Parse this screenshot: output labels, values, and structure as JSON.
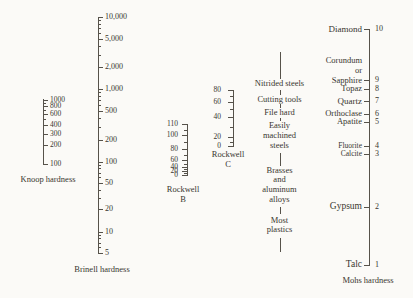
{
  "figure": {
    "bg_color": "#fbfaf7",
    "ink_color": "#39362f",
    "line_color": "#56524a"
  },
  "chart_data": {
    "type": "nomogram",
    "layout_hint": "five vertical scales side by side; vertical position indicates equivalent hardness; middle column annotates typical materials",
    "scales": [
      {
        "id": "knoop",
        "title_lines": [
          "Knoop hardness"
        ],
        "scale_type": "logarithmic",
        "labels_side": "right",
        "geometry": {
          "line_x": 43,
          "top": 99,
          "bottom": 164.5,
          "label_x": 50,
          "num_fs": 7.5,
          "title_x": 48,
          "title_y": 179,
          "title_fs": 8.5,
          "tick_len": 5
        },
        "ticks": [
          {
            "v": 1000,
            "y": 99.5,
            "label": "1000"
          },
          {
            "v": 900,
            "y": 102.6
          },
          {
            "v": 800,
            "y": 105.9,
            "label": "800"
          },
          {
            "v": 700,
            "y": 109.7
          },
          {
            "v": 600,
            "y": 114.0,
            "label": "600"
          },
          {
            "v": 500,
            "y": 119.2
          },
          {
            "v": 400,
            "y": 125.4,
            "label": "400"
          },
          {
            "v": 300,
            "y": 133.5,
            "label": "300"
          },
          {
            "v": 200,
            "y": 144.7,
            "label": "200"
          },
          {
            "v": 100,
            "y": 164.3,
            "label": "100"
          }
        ]
      },
      {
        "id": "brinell",
        "title_lines": [
          "Brinell hardness"
        ],
        "scale_type": "logarithmic",
        "labels_side": "right",
        "geometry": {
          "line_x": 98,
          "top": 17,
          "bottom": 252.5,
          "label_x": 105,
          "num_fs": 8,
          "title_x": 102,
          "title_y": 269,
          "title_fs": 8.5,
          "tick_len": 5
        },
        "ticks": [
          {
            "v": 10000,
            "y": 17.0,
            "label": "10,000"
          },
          {
            "v": 9000,
            "y": 20.3
          },
          {
            "v": 8000,
            "y": 24.0
          },
          {
            "v": 7000,
            "y": 28.2
          },
          {
            "v": 6000,
            "y": 33.0
          },
          {
            "v": 5000,
            "y": 38.7,
            "label": "5,000"
          },
          {
            "v": 4000,
            "y": 45.7
          },
          {
            "v": 3000,
            "y": 54.7
          },
          {
            "v": 2000,
            "y": 67.4,
            "label": "2,000"
          },
          {
            "v": 1000,
            "y": 89.1,
            "label": "1,000"
          },
          {
            "v": 900,
            "y": 92.4
          },
          {
            "v": 800,
            "y": 96.1
          },
          {
            "v": 700,
            "y": 100.3
          },
          {
            "v": 600,
            "y": 105.1
          },
          {
            "v": 500,
            "y": 110.8,
            "label": "500"
          },
          {
            "v": 400,
            "y": 117.8
          },
          {
            "v": 300,
            "y": 126.8
          },
          {
            "v": 200,
            "y": 139.8,
            "label": "200"
          },
          {
            "v": 100,
            "y": 161.5,
            "label": "100"
          },
          {
            "v": 90,
            "y": 164.8
          },
          {
            "v": 80,
            "y": 168.4
          },
          {
            "v": 70,
            "y": 172.6
          },
          {
            "v": 60,
            "y": 177.3
          },
          {
            "v": 50,
            "y": 183.0,
            "label": "50"
          },
          {
            "v": 40,
            "y": 189.5
          },
          {
            "v": 30,
            "y": 198.0
          },
          {
            "v": 20,
            "y": 209.0,
            "label": "20"
          },
          {
            "v": 10,
            "y": 231.5,
            "label": "10"
          },
          {
            "v": 9,
            "y": 234.8
          },
          {
            "v": 8,
            "y": 238.4
          },
          {
            "v": 7,
            "y": 242.5
          },
          {
            "v": 6,
            "y": 247.2
          },
          {
            "v": 5,
            "y": 252.5,
            "label": "5"
          }
        ]
      },
      {
        "id": "rockwell-b",
        "title_lines": [
          "Rockwell",
          "B"
        ],
        "scale_type": "nonlinear",
        "labels_side": "left",
        "geometry": {
          "line_x": 187,
          "top": 124,
          "bottom": 175.5,
          "label_x": 178,
          "num_fs": 7.5,
          "title_x": 183,
          "title_y": 194,
          "title_fs": 8.5,
          "tick_len": 6
        },
        "ticks": [
          {
            "v": 110,
            "y": 124.0,
            "label": "110"
          },
          {
            "v": 105,
            "y": 129.5
          },
          {
            "v": 100,
            "y": 135.0,
            "label": "100"
          },
          {
            "v": 90,
            "y": 142.0
          },
          {
            "v": 80,
            "y": 149.0,
            "label": "80"
          },
          {
            "v": 70,
            "y": 154.5
          },
          {
            "v": 60,
            "y": 159.5,
            "label": "60"
          },
          {
            "v": 50,
            "y": 163.5
          },
          {
            "v": 40,
            "y": 166.5,
            "label": "40"
          },
          {
            "v": 30,
            "y": 168.6
          },
          {
            "v": 20,
            "y": 170.6,
            "label": "20"
          },
          {
            "v": 10,
            "y": 173.0
          },
          {
            "v": 0,
            "y": 175.4,
            "label": "0"
          }
        ]
      },
      {
        "id": "rockwell-c",
        "title_lines": [
          "Rockwell",
          "C"
        ],
        "scale_type": "nonlinear",
        "labels_side": "left",
        "geometry": {
          "line_x": 233,
          "top": 90,
          "bottom": 146,
          "label_x": 221,
          "num_fs": 7.5,
          "title_x": 228,
          "title_y": 159,
          "title_fs": 8.5,
          "tick_len": 6
        },
        "ticks": [
          {
            "v": 80,
            "y": 90.0,
            "label": "80"
          },
          {
            "v": 70,
            "y": 96.0
          },
          {
            "v": 60,
            "y": 102.0,
            "label": "60"
          },
          {
            "v": 50,
            "y": 109.0
          },
          {
            "v": 40,
            "y": 117.0,
            "label": "40"
          },
          {
            "v": 30,
            "y": 127.0
          },
          {
            "v": 20,
            "y": 137.0,
            "label": "20"
          },
          {
            "v": 10,
            "y": 141.5
          },
          {
            "v": 0,
            "y": 146.0,
            "label": "0"
          }
        ]
      },
      {
        "id": "mohs",
        "title_lines": [
          "Mohs hardness"
        ],
        "scale_type": "ordinal",
        "labels_side": "both",
        "geometry": {
          "line_x": 369,
          "top": 29,
          "bottom": 265,
          "label_x": 375,
          "num_fs": 8,
          "names_right_x": 362,
          "title_x": 368,
          "title_y": 279.5,
          "title_fs": 8.5,
          "tick_len": 6.5
        },
        "ticks": [
          {
            "v": 10,
            "y": 29.0,
            "label": "10"
          },
          {
            "v": 9,
            "y": 80.0,
            "label": "9"
          },
          {
            "v": 8,
            "y": 88.5,
            "label": "8"
          },
          {
            "v": 7,
            "y": 100.5,
            "label": "7"
          },
          {
            "v": 6,
            "y": 113.5,
            "label": "6"
          },
          {
            "v": 5,
            "y": 122.0,
            "label": "5"
          },
          {
            "v": 4,
            "y": 145.5,
            "label": "4"
          },
          {
            "v": 3,
            "y": 154.0,
            "label": "3"
          },
          {
            "v": 2,
            "y": 207.0,
            "label": "2"
          },
          {
            "v": 1,
            "y": 265.0,
            "label": "1"
          }
        ],
        "minerals": [
          {
            "mohs": 10,
            "lines": [
              "Diamond"
            ],
            "y": 28.5,
            "fs": 9
          },
          {
            "mohs": 9,
            "lines": [
              "Corundum",
              "or",
              "Sapphire"
            ],
            "y": 71.0,
            "fs": 8.5
          },
          {
            "mohs": 8,
            "lines": [
              "Topaz"
            ],
            "y": 88.5,
            "fs": 8.5
          },
          {
            "mohs": 7,
            "lines": [
              "Quartz"
            ],
            "y": 100.5,
            "fs": 9
          },
          {
            "mohs": 6,
            "lines": [
              "Orthoclase"
            ],
            "y": 113.5,
            "fs": 8.5
          },
          {
            "mohs": 5,
            "lines": [
              "Apatite"
            ],
            "y": 122.0,
            "fs": 8.5
          },
          {
            "mohs": 4,
            "lines": [
              "Fluorite"
            ],
            "y": 145.5,
            "fs": 7.5
          },
          {
            "mohs": 3,
            "lines": [
              "Calcite"
            ],
            "y": 154.0,
            "fs": 7.5
          },
          {
            "mohs": 2,
            "lines": [
              "Gypsum"
            ],
            "y": 207.0,
            "fs": 9.5
          },
          {
            "mohs": 1,
            "lines": [
              "Talc"
            ],
            "y": 265.0,
            "fs": 9.5
          }
        ]
      }
    ],
    "annotations": {
      "x": 279.5,
      "fs": 8.5,
      "segments": [
        [
          52,
          79
        ],
        [
          90,
          95
        ],
        [
          104,
          107.5
        ],
        [
          117.5,
          121
        ],
        [
          153,
          165.5
        ],
        [
          207,
          214
        ],
        [
          238,
          252
        ]
      ],
      "items": [
        {
          "lines": [
            "Nitrided steels"
          ],
          "y": 83.5
        },
        {
          "lines": [
            "Cutting tools"
          ],
          "y": 99.5
        },
        {
          "lines": [
            "File hard"
          ],
          "y": 113
        },
        {
          "lines": [
            "Easily",
            "machined",
            "steels"
          ],
          "y": 136
        },
        {
          "lines": [
            "Brasses",
            "and",
            "aluminum",
            "alloys"
          ],
          "y": 185.5
        },
        {
          "lines": [
            "Most",
            "plastics"
          ],
          "y": 225.5
        }
      ]
    }
  }
}
